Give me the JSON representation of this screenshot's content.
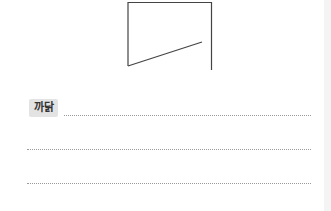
{
  "figure": {
    "shape": "quadrilateral-outline",
    "stroke_color": "#444444"
  },
  "answer_section": {
    "label": "까닭",
    "label_bg": "#e3e3e3",
    "lines": [
      {
        "value": "",
        "placeholder": ""
      },
      {
        "value": "",
        "placeholder": ""
      },
      {
        "value": "",
        "placeholder": ""
      }
    ]
  }
}
